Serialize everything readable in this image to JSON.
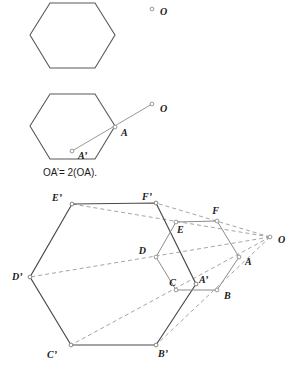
{
  "figure": {
    "caption": "OA’= 2(OA).",
    "colors": {
      "solid_stroke": "#595959",
      "dark_stroke": "#4a4a4a",
      "dashed_stroke": "#9a9a9a",
      "light_stroke": "#8c8c8c",
      "marker_fill": "#ffffff",
      "text": "#1a1a1a"
    },
    "panels": [
      {
        "name": "top-panel",
        "labels": [
          {
            "text": "O",
            "x": 160,
            "y": 15
          }
        ],
        "markers": [
          {
            "name": "point-o",
            "x": 152,
            "y": 9
          }
        ],
        "hexagon": {
          "name": "hexagon-top",
          "points": "30,35 50,3 95,3 115,35 95,68 50,68",
          "clipped_top": true
        }
      },
      {
        "name": "middle-panel",
        "labels": [
          {
            "text": "O",
            "x": 160,
            "y": 112
          },
          {
            "text": "A",
            "x": 121,
            "y": 136
          },
          {
            "text": "A’",
            "x": 78,
            "y": 159
          }
        ],
        "markers": [
          {
            "name": "point-o",
            "x": 152,
            "y": 104
          },
          {
            "name": "point-a",
            "x": 115,
            "y": 127
          },
          {
            "name": "point-a-prime",
            "x": 72,
            "y": 151
          }
        ],
        "hexagon": {
          "name": "hexagon-middle",
          "points": "30,126 50,94 95,94 115,126 95,159 50,159"
        },
        "ray": {
          "name": "ray-o-a-aprime",
          "x1": 152,
          "y1": 104,
          "x2": 72,
          "y2": 151
        },
        "caption": {
          "text": "OA’= 2(OA).",
          "x": 43,
          "y": 176
        }
      },
      {
        "name": "bottom-panel",
        "labels": [
          {
            "text": "E’",
            "x": 62,
            "y": 201
          },
          {
            "text": "F’",
            "x": 152,
            "y": 200
          },
          {
            "text": "F",
            "x": 219,
            "y": 214
          },
          {
            "text": "E",
            "x": 177,
            "y": 230
          },
          {
            "text": "D",
            "x": 146,
            "y": 252
          },
          {
            "text": "A",
            "x": 245,
            "y": 265
          },
          {
            "text": "D’",
            "x": 12,
            "y": 277
          },
          {
            "text": "C",
            "x": 176,
            "y": 288
          },
          {
            "text": "A’",
            "x": 197,
            "y": 285
          },
          {
            "text": "B",
            "x": 224,
            "y": 296
          },
          {
            "text": "C’",
            "x": 57,
            "y": 358
          },
          {
            "text": "B’",
            "x": 156,
            "y": 357
          },
          {
            "text": "O",
            "x": 278,
            "y": 243
          }
        ],
        "markers": [
          {
            "name": "point-e-prime",
            "x": 72,
            "y": 204
          },
          {
            "name": "point-f-prime",
            "x": 156,
            "y": 203
          },
          {
            "name": "point-f",
            "x": 217,
            "y": 221
          },
          {
            "name": "point-e",
            "x": 176,
            "y": 222
          },
          {
            "name": "point-d",
            "x": 156,
            "y": 257
          },
          {
            "name": "point-a",
            "x": 239,
            "y": 257
          },
          {
            "name": "point-d-prime",
            "x": 30,
            "y": 277
          },
          {
            "name": "point-c",
            "x": 176,
            "y": 290
          },
          {
            "name": "point-a-prime",
            "x": 196,
            "y": 284
          },
          {
            "name": "point-b",
            "x": 217,
            "y": 290
          },
          {
            "name": "point-c-prime",
            "x": 71,
            "y": 345
          },
          {
            "name": "point-b-prime",
            "x": 156,
            "y": 345
          },
          {
            "name": "point-o",
            "x": 270,
            "y": 237
          }
        ],
        "inner_hexagon": {
          "name": "hexagon-inner-abcdef",
          "points": "239,257 217,290 176,290 156,257 176,222 217,221"
        },
        "outer_hexagon": {
          "name": "hexagon-outer-abcdef-prime",
          "points": "196,284 156,345 71,345 30,277 72,204 156,203"
        },
        "dashed_rays": [
          {
            "name": "ray-o-e-eprime",
            "x1": 270,
            "y1": 237,
            "x2": 72,
            "y2": 204
          },
          {
            "name": "ray-o-f-fprime",
            "x1": 270,
            "y1": 237,
            "x2": 156,
            "y2": 203
          },
          {
            "name": "ray-o-d-dprime",
            "x1": 270,
            "y1": 237,
            "x2": 30,
            "y2": 277
          },
          {
            "name": "ray-o-c-cprime",
            "x1": 270,
            "y1": 237,
            "x2": 71,
            "y2": 345
          },
          {
            "name": "ray-o-b-bprime",
            "x1": 270,
            "y1": 237,
            "x2": 156,
            "y2": 345
          }
        ]
      }
    ]
  }
}
